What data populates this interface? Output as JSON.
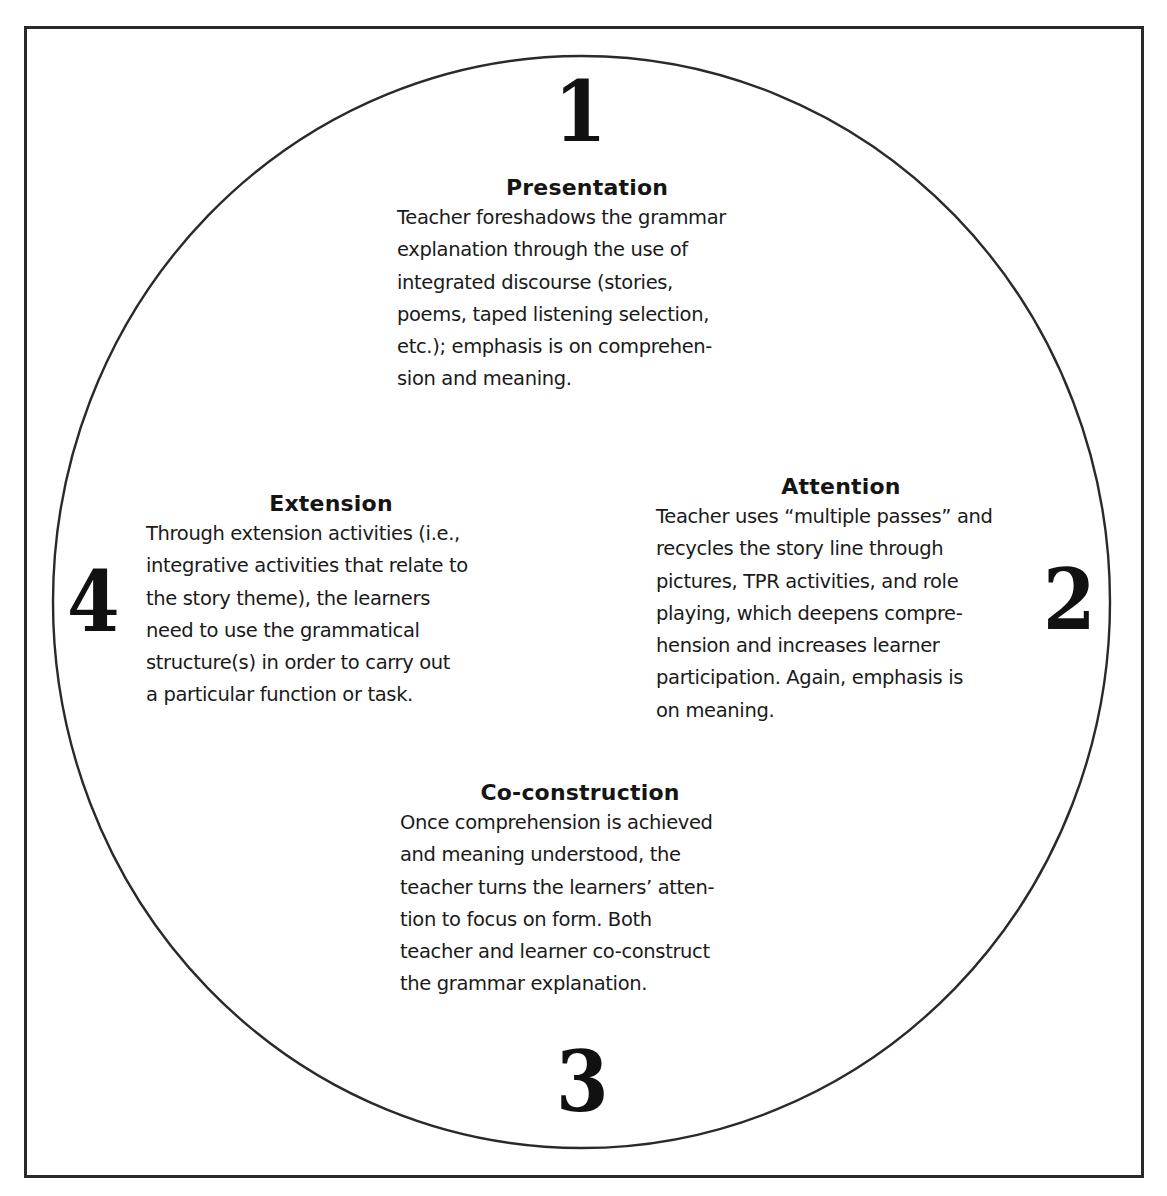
{
  "diagram": {
    "type": "cycle",
    "stages": [
      {
        "number": "1",
        "title": "Presentation",
        "lines": [
          "Teacher foreshadows the grammar",
          "explanation through the use of",
          "integrated discourse (stories,",
          "poems, taped listening selection,",
          "etc.); emphasis is on comprehen-",
          "sion and meaning."
        ]
      },
      {
        "number": "2",
        "title": "Attention",
        "lines": [
          "Teacher uses “multiple passes” and",
          "recycles the story line through",
          "pictures, TPR activities, and role",
          "playing, which deepens compre-",
          "hension and increases learner",
          "participation. Again, emphasis is",
          "on meaning."
        ]
      },
      {
        "number": "3",
        "title": "Co-construction",
        "lines": [
          "Once comprehension is achieved",
          "and meaning understood, the",
          "teacher turns the learners’ atten-",
          "tion to focus on form. Both",
          "teacher and learner co-construct",
          "the grammar explanation."
        ]
      },
      {
        "number": "4",
        "title": "Extension",
        "lines": [
          "Through extension activities (i.e.,",
          "integrative activities that relate to",
          "the story theme), the learners",
          "need to use the grammatical",
          "structure(s) in order to carry out",
          "a particular function or task."
        ]
      }
    ],
    "colors": {
      "stroke": "#2a2a2a",
      "text": "#1a1a1a",
      "background": "#ffffff"
    }
  }
}
